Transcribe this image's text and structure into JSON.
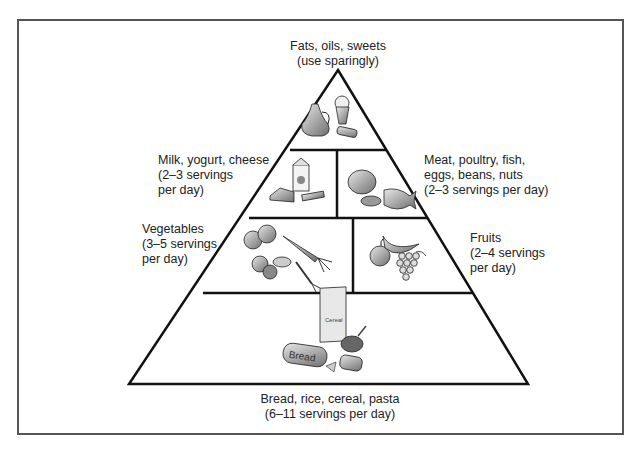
{
  "diagram": {
    "type": "food-guide-pyramid",
    "tiers": [
      {
        "id": "fats",
        "label_line1": "Fats, oils, sweets",
        "label_line2": "(use sparingly)",
        "icons": [
          "oil-cruet-icon",
          "ice-cream-cone-icon",
          "candy-bar-icon"
        ]
      },
      {
        "id": "milk",
        "label_line1": "Milk, yogurt, cheese",
        "label_line2": "(2–3 servings",
        "label_line3": "per day)",
        "icons": [
          "milk-carton-icon",
          "cheese-wedge-icon",
          "yogurt-icon"
        ]
      },
      {
        "id": "meat",
        "label_line1": "Meat, poultry, fish,",
        "label_line2": "eggs, beans, nuts",
        "label_line3": "(2–3 servings per day)",
        "icons": [
          "poultry-icon",
          "fish-icon"
        ]
      },
      {
        "id": "vegetables",
        "label_line1": "Vegetables",
        "label_line2": "(3–5 servings",
        "label_line3": "per day)",
        "icons": [
          "tomato-icon",
          "carrot-icon",
          "broccoli-icon"
        ]
      },
      {
        "id": "fruits",
        "label_line1": "Fruits",
        "label_line2": "(2–4 servings",
        "label_line3": "per day)",
        "icons": [
          "apple-icon",
          "banana-icon",
          "grapes-icon"
        ]
      },
      {
        "id": "grains",
        "label_line1": "Bread, rice, cereal, pasta",
        "label_line2": "(6–11 servings per day)",
        "icons": [
          "cereal-box-icon",
          "bread-loaf-icon",
          "cereal-bowl-icon",
          "sandwich-icon"
        ],
        "cereal_text": "Cereal",
        "bread_text": "Bread"
      }
    ],
    "colors": {
      "line": "#111111",
      "frame": "#555555",
      "text": "#222222",
      "icon_fill": "#9a9a9a"
    }
  }
}
